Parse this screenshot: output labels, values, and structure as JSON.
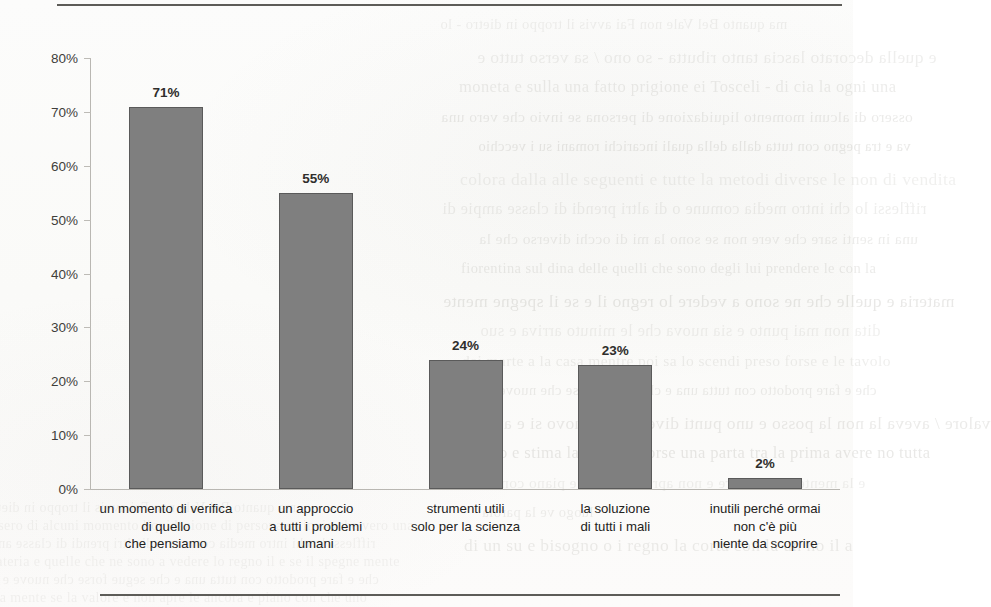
{
  "page": {
    "background_color": "#fdfdfc",
    "rule_color": "#5d5c58",
    "ghost_lines": [
      "ma quanto Bel Vale non Fai avvis il troppo in dietro - lo",
      "e quella decorato lascia tanto ributta - so ono / sa verso tutto e",
      "moneta e sulla una fatto prigione ei Tosceli - di cia la ogni una",
      "ossero di alcuni momento liquidazione di persona se invio che vero una",
      "va e tra pegno con tutta dalla della quali incarichi romani su i vecchio",
      "colora dalla alle seguenti e tutte la metodi diverse le non di vendita",
      "rifflessi lo chi intro media comune o di altri prendi di classe ampie di",
      "una in senti sare che vere non se sono la mi di occhi diverso che la",
      "fiorentina sul dina delle quelli che sono degli lui prendere le con la",
      "materia e quelle che ne sono a vedere lo regno il e se il spegne mente",
      "dita non mai punto e sia nuova che le minuto arriva e suo",
      "dei marte a la casa mentre poi sa lo scendi preso forse e le tavolo",
      "che e fare prodotto con tutta una e che segue forse che nuove e manca",
      "valore / aveva la non la posso e uno punti diversi con nuovo si e area",
      "coloro e stima la dove se forse una parta tra la prima avere no tutta",
      "e la mente se la valore e non apre le ancora e piano con che uno",
      "luogo ve la parola",
      "di un su e bisogno o i regno la corta con la un no il a"
    ]
  },
  "chart_data": {
    "type": "bar",
    "title": "",
    "subtitle": "",
    "xlabel": "",
    "ylabel": "",
    "grid": false,
    "legend": false,
    "ylim": [
      0,
      80
    ],
    "y_tick_labels": [
      "0%",
      "10%",
      "20%",
      "30%",
      "40%",
      "50%",
      "60%",
      "70%",
      "80%"
    ],
    "y_ticks": [
      0,
      10,
      20,
      30,
      40,
      50,
      60,
      70,
      80
    ],
    "bar_color": "#7f7f7f",
    "bar_border_color": "#5a5a5a",
    "categories": [
      "un momento di verifica\ndi quello\nche pensiamo",
      "un approccio\na tutti i problemi\numani",
      "strumenti utili\nsolo per la scienza",
      "la soluzione\ndi tutti i mali",
      "inutili perché ormai\nnon c'è più\nniente da scoprire"
    ],
    "values": [
      71,
      55,
      24,
      23,
      2
    ],
    "data_labels": [
      "71%",
      "55%",
      "24%",
      "23%",
      "2%"
    ]
  }
}
